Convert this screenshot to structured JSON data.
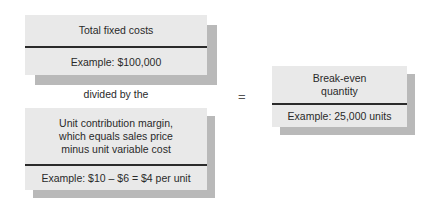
{
  "numerator": {
    "title": "Total fixed costs",
    "example": "Example: $100,000"
  },
  "operator_text": "divided by the",
  "denominator": {
    "title_lines": [
      "Unit contribution margin,",
      "which equals sales price",
      "minus unit variable cost"
    ],
    "example": "Example: $10 – $6 = $4 per unit"
  },
  "equals_sign": "=",
  "result": {
    "title_lines": [
      "Break-even",
      "quantity"
    ],
    "example": "Example: 25,000 units"
  }
}
